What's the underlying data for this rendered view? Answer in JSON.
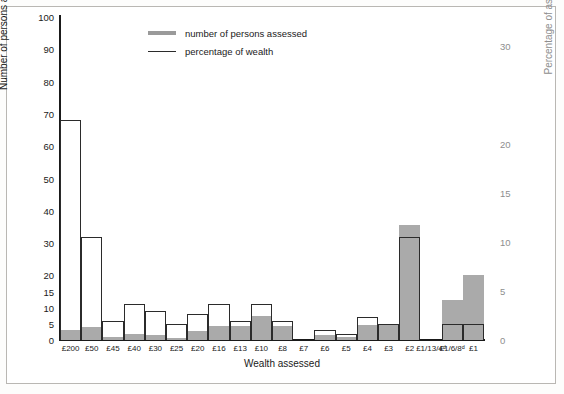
{
  "chart_data": {
    "type": "bar",
    "title": "",
    "xlabel": "Wealth assessed",
    "ylabel": "Number of persons assessed",
    "ylabel_right": "Percentage of assessed wealth",
    "grid": false,
    "legend_position": "top-center",
    "ylim": [
      0,
      100
    ],
    "ylim_right": [
      0,
      33
    ],
    "yticks": [
      0,
      5,
      10,
      15,
      20,
      30,
      40,
      50,
      60,
      70,
      80,
      90,
      100
    ],
    "yticks_right": [
      0,
      5,
      10,
      15,
      20,
      30
    ],
    "categories": [
      "£200",
      "£50",
      "£45",
      "£40",
      "£30",
      "£25",
      "£20",
      "£16",
      "£13",
      "£10",
      "£8",
      "£7",
      "£6",
      "£5",
      "£4",
      "£3",
      "£2",
      "£1/13/4ᵈ",
      "£1/6/8ᵈ",
      "£1"
    ],
    "series": [
      {
        "name": "number of persons assessed",
        "axis": "left",
        "style": "outline",
        "color": "#2b2b2b",
        "values": [
          68,
          32,
          6,
          11,
          9,
          5,
          8,
          11,
          6,
          11,
          6,
          0,
          3,
          2,
          7,
          5,
          32,
          0,
          5,
          5
        ]
      },
      {
        "name": "percentage of wealth",
        "axis": "right",
        "style": "filled",
        "color": "#aaaaaa",
        "values": [
          1.0,
          1.3,
          0.3,
          0.6,
          0.5,
          0.25,
          0.9,
          1.4,
          1.4,
          2.5,
          1.4,
          0.0,
          0.55,
          0.35,
          1.5,
          1.5,
          11.7,
          0.0,
          4.1,
          6.6
        ]
      }
    ]
  },
  "legend": {
    "items": [
      {
        "label": "number of persons assessed"
      },
      {
        "label": "percentage of wealth"
      }
    ]
  }
}
